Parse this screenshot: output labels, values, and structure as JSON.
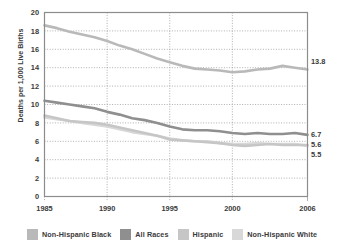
{
  "chart_data": {
    "type": "line",
    "title": "",
    "xlabel": "",
    "ylabel": "Deaths per 1,000 Live Births",
    "xlim": [
      1985,
      2006
    ],
    "ylim": [
      0,
      20
    ],
    "ytick_step": 2,
    "grid": true,
    "grid_style": "dotted",
    "legend_position": "bottom",
    "yticks": [
      "0",
      "2",
      "4",
      "6",
      "8",
      "10",
      "12",
      "14",
      "16",
      "18",
      "20"
    ],
    "xticks": [
      "1985",
      "1990",
      "1995",
      "2000",
      "2006"
    ],
    "xtick_values": [
      1985,
      1990,
      1995,
      2000,
      2006
    ],
    "x": [
      1985,
      1986,
      1987,
      1988,
      1989,
      1990,
      1991,
      1992,
      1993,
      1994,
      1995,
      1996,
      1997,
      1998,
      1999,
      2000,
      2001,
      2002,
      2003,
      2004,
      2005,
      2006
    ],
    "series": [
      {
        "name": "Non-Hispanic Black",
        "color": "#b9b9b9",
        "end_label": "13.8",
        "values": [
          18.6,
          18.3,
          17.9,
          17.6,
          17.3,
          16.9,
          16.4,
          16.0,
          15.5,
          15.0,
          14.6,
          14.2,
          13.9,
          13.8,
          13.7,
          13.5,
          13.6,
          13.8,
          13.9,
          14.2,
          14.0,
          13.8
        ]
      },
      {
        "name": "All Races",
        "color": "#8f8f8f",
        "end_label": "6.7",
        "values": [
          10.4,
          10.2,
          10.0,
          9.8,
          9.6,
          9.2,
          8.9,
          8.5,
          8.3,
          8.0,
          7.6,
          7.3,
          7.2,
          7.2,
          7.1,
          6.9,
          6.8,
          6.9,
          6.8,
          6.8,
          6.9,
          6.7
        ]
      },
      {
        "name": "Hispanic",
        "color": "#c6c6c6",
        "end_label": "5.6",
        "values": [
          8.8,
          8.5,
          8.2,
          8.1,
          8.0,
          7.8,
          7.5,
          7.2,
          6.9,
          6.6,
          6.2,
          6.1,
          6.0,
          5.9,
          5.8,
          5.6,
          5.5,
          5.6,
          5.7,
          5.6,
          5.6,
          5.6
        ]
      },
      {
        "name": "Non-Hispanic White",
        "color": "#d8d8d8",
        "end_label": "5.5",
        "values": [
          8.6,
          8.4,
          8.2,
          8.0,
          7.8,
          7.6,
          7.3,
          7.0,
          6.8,
          6.6,
          6.3,
          6.1,
          6.0,
          6.0,
          5.8,
          5.7,
          5.7,
          5.8,
          5.7,
          5.7,
          5.7,
          5.5
        ]
      }
    ],
    "data_labels": [
      {
        "text": "13.8",
        "series": "Non-Hispanic Black"
      },
      {
        "text": "6.7",
        "series": "All Races"
      },
      {
        "text": "5.6",
        "series": "Hispanic"
      },
      {
        "text": "5.5",
        "series": "Non-Hispanic White"
      }
    ]
  },
  "legend": {
    "items": [
      {
        "label": "Non-Hispanic Black",
        "color": "#b9b9b9"
      },
      {
        "label": "All Races",
        "color": "#8f8f8f"
      },
      {
        "label": "Hispanic",
        "color": "#c6c6c6"
      },
      {
        "label": "Non-Hispanic White",
        "color": "#d8d8d8"
      }
    ]
  },
  "axes": {
    "y_axis_title": "Deaths per 1,000 Live Births"
  },
  "colors": {
    "frame": "#8c8c8c",
    "grid": "#9a9a9a",
    "text": "#3a3a3a",
    "background": "#ffffff"
  }
}
